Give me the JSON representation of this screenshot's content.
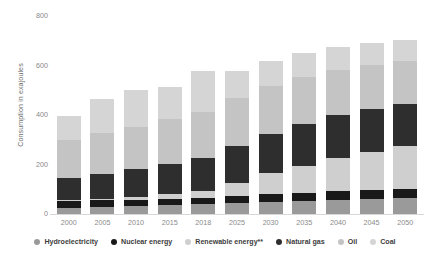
{
  "chart_data": {
    "type": "bar",
    "subtype": "stacked-bar",
    "title": "",
    "xlabel": "",
    "ylabel": "Consumption in exajoules",
    "ylim": [
      0,
      800
    ],
    "yticks": [
      0,
      200,
      400,
      600,
      800
    ],
    "grid": false,
    "legend_position": "bottom",
    "categories": [
      "2000",
      "2005",
      "2010",
      "2015",
      "2018",
      "2025",
      "2030",
      "2035",
      "2040",
      "2045",
      "2050"
    ],
    "series": [
      {
        "name": "Hydroelectricity",
        "color": "#9a9a9a",
        "values": [
          26,
          28,
          31,
          35,
          39,
          44,
          49,
          53,
          57,
          60,
          63
        ]
      },
      {
        "name": "Nuclear energy",
        "color": "#191919",
        "values": [
          26,
          28,
          26,
          25,
          25,
          28,
          31,
          33,
          35,
          37,
          39
        ]
      },
      {
        "name": "Renewable energy**",
        "color": "#cfcfcf",
        "values": [
          4,
          6,
          10,
          19,
          28,
          55,
          85,
          110,
          135,
          155,
          172
        ]
      },
      {
        "name": "Natural gas",
        "color": "#2e2e2e",
        "values": [
          90,
          101,
          113,
          122,
          133,
          148,
          160,
          168,
          172,
          172,
          170
        ]
      },
      {
        "name": "Oil",
        "color": "#c4c4c4",
        "values": [
          155,
          165,
          172,
          182,
          188,
          192,
          193,
          190,
          185,
          180,
          175
        ]
      },
      {
        "name": "Coal",
        "color": "#d5d5d5",
        "values": [
          96,
          135,
          150,
          130,
          165,
          110,
          100,
          95,
          90,
          88,
          86
        ]
      }
    ],
    "totals": [
      397,
      463,
      502,
      513,
      578,
      577,
      618,
      649,
      674,
      692,
      705
    ]
  },
  "axis": {
    "y_title": "Consumption in exajoules",
    "y_ticks": [
      "800",
      "600",
      "400",
      "200",
      "0"
    ]
  },
  "legend": {
    "items": [
      {
        "label": "Hydroelectricity",
        "color": "#9a9a9a"
      },
      {
        "label": "Nuclear energy",
        "color": "#191919"
      },
      {
        "label": "Renewable energy**",
        "color": "#cfcfcf"
      },
      {
        "label": "Natural gas",
        "color": "#2e2e2e"
      },
      {
        "label": "Oil",
        "color": "#c4c4c4"
      },
      {
        "label": "Coal",
        "color": "#d5d5d5"
      }
    ]
  }
}
